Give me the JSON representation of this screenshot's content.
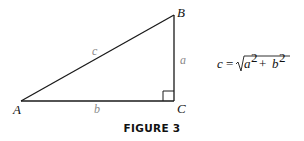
{
  "figure": {
    "caption": "FIGURE 3",
    "vertices": {
      "A": "A",
      "B": "B",
      "C": "C"
    },
    "sides": {
      "a": "a",
      "b": "b",
      "c": "c"
    },
    "formula": {
      "lhs": "c =",
      "radicand_a": "a",
      "exp_a": "2",
      "plus": "+",
      "radicand_b": "b",
      "exp_b": "2"
    }
  }
}
